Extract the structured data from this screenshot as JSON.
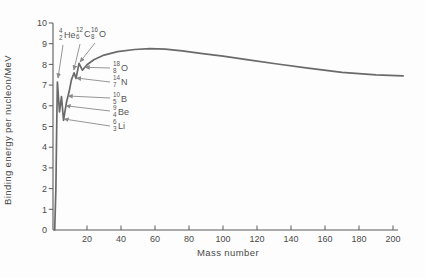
{
  "figure": {
    "title": "",
    "background": "#fdfdfd",
    "text_color": "#4a4a4a",
    "axis_color": "#5a5a5a",
    "arrow_color": "#8a8a8a"
  },
  "chart_data": {
    "type": "line",
    "title": "",
    "xlabel": "Mass number",
    "ylabel": "Binding energy per nucleon/MeV",
    "xlim": [
      0,
      210
    ],
    "ylim": [
      0,
      10
    ],
    "x_ticks": [
      20,
      40,
      60,
      80,
      100,
      120,
      140,
      160,
      180,
      200
    ],
    "y_ticks": [
      0,
      1,
      2,
      3,
      4,
      5,
      6,
      7,
      8,
      9,
      10
    ],
    "grid": false,
    "legend": "none",
    "series": [
      {
        "name": "binding-energy-per-nucleon",
        "color": "#6a6a6a",
        "points": [
          [
            1,
            0
          ],
          [
            1.7,
            2.0
          ],
          [
            2.2,
            5.0
          ],
          [
            2.6,
            7.15
          ],
          [
            3.8,
            5.7
          ],
          [
            5.0,
            6.45
          ],
          [
            6.2,
            5.3
          ],
          [
            8.0,
            6.2
          ],
          [
            9.5,
            6.7
          ],
          [
            10.8,
            7.25
          ],
          [
            12.4,
            7.6
          ],
          [
            13.5,
            7.32
          ],
          [
            15.3,
            8.05
          ],
          [
            17.3,
            7.72
          ],
          [
            20,
            7.98
          ],
          [
            24,
            8.22
          ],
          [
            30,
            8.45
          ],
          [
            38,
            8.62
          ],
          [
            48,
            8.72
          ],
          [
            57,
            8.76
          ],
          [
            66,
            8.74
          ],
          [
            76,
            8.65
          ],
          [
            88,
            8.52
          ],
          [
            100,
            8.4
          ],
          [
            115,
            8.22
          ],
          [
            132,
            8.02
          ],
          [
            150,
            7.82
          ],
          [
            170,
            7.62
          ],
          [
            190,
            7.5
          ],
          [
            206,
            7.45
          ]
        ]
      }
    ],
    "annotations": [
      {
        "id": "He-4",
        "mass": "4",
        "z": "2",
        "symbol": "He",
        "label_px": [
          59,
          35
        ],
        "arrow": [
          [
            63,
            45
          ],
          [
            58,
            78
          ]
        ]
      },
      {
        "id": "C-12",
        "mass": "12",
        "z": "6",
        "symbol": "C",
        "label_px": [
          76,
          34
        ],
        "arrow": [
          [
            80,
            44
          ],
          [
            73.8,
            70
          ]
        ]
      },
      {
        "id": "O-16",
        "mass": "16",
        "z": "8",
        "symbol": "O",
        "label_px": [
          91,
          34
        ],
        "arrow": [
          [
            95,
            43
          ],
          [
            80,
            62
          ]
        ]
      },
      {
        "id": "O-18",
        "mass": "18",
        "z": "8",
        "symbol": "O",
        "label_px": [
          113,
          68
        ],
        "arrow": [
          [
            110,
            68
          ],
          [
            85,
            67.3
          ]
        ]
      },
      {
        "id": "N-14",
        "mass": "14",
        "z": "7",
        "symbol": "N",
        "label_px": [
          113,
          82
        ],
        "arrow": [
          [
            110,
            82
          ],
          [
            76.4,
            78
          ]
        ]
      },
      {
        "id": "B-10",
        "mass": "10",
        "z": "5",
        "symbol": "B",
        "label_px": [
          113,
          99
        ],
        "arrow": [
          [
            110,
            98
          ],
          [
            68,
            96
          ]
        ]
      },
      {
        "id": "Be-9",
        "mass": "9",
        "z": "4",
        "symbol": "Be",
        "label_px": [
          113,
          112
        ],
        "arrow": [
          [
            110,
            111
          ],
          [
            66,
            105.8
          ]
        ]
      },
      {
        "id": "Li-6",
        "mass": "6",
        "z": "3",
        "symbol": "Li",
        "label_px": [
          113,
          126
        ],
        "arrow": [
          [
            110,
            126
          ],
          [
            64,
            119
          ]
        ]
      }
    ]
  }
}
